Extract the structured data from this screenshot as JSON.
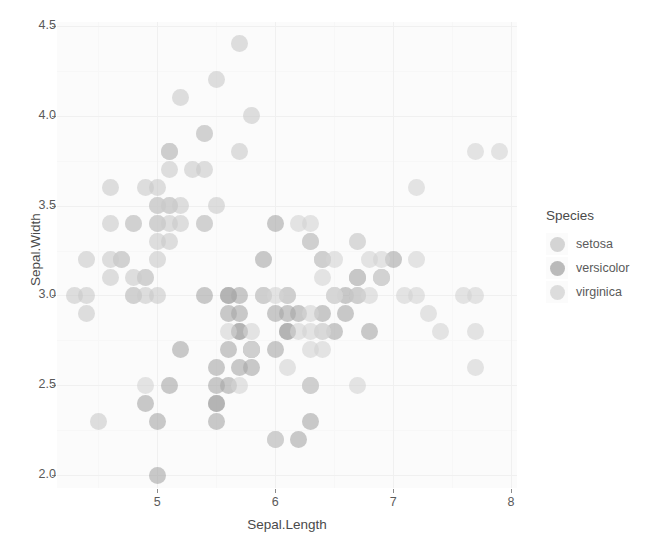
{
  "toolbar": {
    "visible_fragment": true,
    "icons": [
      "save-icon",
      "folder-icon",
      "cursor-icon",
      "zoom-icon"
    ],
    "field_placeholder": ""
  },
  "chart": {
    "type": "scatter",
    "panel_background": "#fbfbfb",
    "grid": "on",
    "point_opacity": 0.62,
    "point_size_px": 17
  },
  "axes": {
    "x": {
      "label": "Sepal.Length",
      "ticks": [
        "5",
        "6",
        "7",
        "8"
      ],
      "tick_values": [
        5,
        6,
        7,
        8
      ],
      "range": [
        4.15,
        8.05
      ]
    },
    "y": {
      "label": "Sepal.Width",
      "ticks": [
        "4.5",
        "4.0",
        "3.5",
        "3.0",
        "2.5",
        "2.0"
      ],
      "tick_values": [
        4.5,
        4.0,
        3.5,
        3.0,
        2.5,
        2.0
      ],
      "range": [
        1.93,
        4.52
      ]
    }
  },
  "legend": {
    "title": "Species",
    "position": "right",
    "items": [
      {
        "label": "setosa",
        "color": "#c9c9c9"
      },
      {
        "label": "versicolor",
        "color": "#a8a8a8"
      },
      {
        "label": "virginica",
        "color": "#d4d4d4"
      }
    ]
  },
  "chart_data": {
    "type": "scatter",
    "title": "",
    "xlabel": "Sepal.Length",
    "ylabel": "Sepal.Width",
    "xlim": [
      4.15,
      8.05
    ],
    "ylim": [
      1.93,
      4.52
    ],
    "xticks": [
      5,
      6,
      7,
      8
    ],
    "yticks": [
      2.0,
      2.5,
      3.0,
      3.5,
      4.0,
      4.5
    ],
    "grid": true,
    "legend_title": "Species",
    "legend_position": "right",
    "series": [
      {
        "name": "setosa",
        "color": "#c9c9c9",
        "x": [
          5.1,
          4.9,
          4.7,
          4.6,
          5.0,
          5.4,
          4.6,
          5.0,
          4.4,
          4.9,
          5.4,
          4.8,
          4.8,
          4.3,
          5.8,
          5.7,
          5.4,
          5.1,
          5.7,
          5.1,
          5.4,
          5.1,
          4.6,
          5.1,
          4.8,
          5.0,
          5.0,
          5.2,
          5.2,
          4.7,
          4.8,
          5.4,
          5.2,
          5.5,
          4.9,
          5.0,
          5.5,
          4.9,
          4.4,
          5.1,
          5.0,
          4.5,
          4.4,
          5.0,
          5.1,
          4.8,
          5.1,
          4.6,
          5.3,
          5.0
        ],
        "y": [
          3.5,
          3.0,
          3.2,
          3.1,
          3.6,
          3.9,
          3.4,
          3.4,
          2.9,
          3.1,
          3.7,
          3.4,
          3.0,
          3.0,
          4.0,
          4.4,
          3.9,
          3.5,
          3.8,
          3.8,
          3.4,
          3.7,
          3.6,
          3.3,
          3.4,
          3.0,
          3.4,
          3.5,
          3.4,
          3.2,
          3.1,
          3.4,
          4.1,
          4.2,
          3.1,
          3.2,
          3.5,
          3.6,
          3.0,
          3.4,
          3.5,
          2.3,
          3.2,
          3.5,
          3.8,
          3.0,
          3.8,
          3.2,
          3.7,
          3.3
        ]
      },
      {
        "name": "versicolor",
        "color": "#a8a8a8",
        "x": [
          7.0,
          6.4,
          6.9,
          5.5,
          6.5,
          5.7,
          6.3,
          4.9,
          6.6,
          5.2,
          5.0,
          5.9,
          6.0,
          6.1,
          5.6,
          6.7,
          5.6,
          5.8,
          6.2,
          5.6,
          5.9,
          6.1,
          6.3,
          6.1,
          6.4,
          6.6,
          6.8,
          6.7,
          6.0,
          5.7,
          5.5,
          5.5,
          5.8,
          6.0,
          5.4,
          6.0,
          6.7,
          6.3,
          5.6,
          5.5,
          5.5,
          6.1,
          5.8,
          5.0,
          5.6,
          5.7,
          5.7,
          6.2,
          5.1,
          5.7
        ],
        "y": [
          3.2,
          3.2,
          3.1,
          2.3,
          2.8,
          2.8,
          3.3,
          2.4,
          2.9,
          2.7,
          2.0,
          3.0,
          2.2,
          2.9,
          2.9,
          3.1,
          3.0,
          2.7,
          2.2,
          2.5,
          3.2,
          2.8,
          2.5,
          2.8,
          2.9,
          3.0,
          2.8,
          3.0,
          2.9,
          2.6,
          2.4,
          2.4,
          2.7,
          2.7,
          3.0,
          3.4,
          3.1,
          2.3,
          3.0,
          2.5,
          2.6,
          3.0,
          2.6,
          2.3,
          2.7,
          3.0,
          2.9,
          2.9,
          2.5,
          2.8
        ]
      },
      {
        "name": "virginica",
        "color": "#d4d4d4",
        "x": [
          6.3,
          5.8,
          7.1,
          6.3,
          6.5,
          7.6,
          4.9,
          7.3,
          6.7,
          7.2,
          6.5,
          6.4,
          6.8,
          5.7,
          5.8,
          6.4,
          6.5,
          7.7,
          7.7,
          6.0,
          6.9,
          5.6,
          7.7,
          6.3,
          6.7,
          7.2,
          6.2,
          6.1,
          6.4,
          7.2,
          7.4,
          7.9,
          6.4,
          6.3,
          6.1,
          7.7,
          6.3,
          6.4,
          6.0,
          6.9,
          6.7,
          6.9,
          5.8,
          6.8,
          6.7,
          6.7,
          6.3,
          6.5,
          6.2,
          5.9
        ],
        "y": [
          3.3,
          2.7,
          3.0,
          2.9,
          3.0,
          3.0,
          2.5,
          2.9,
          2.5,
          3.6,
          3.2,
          2.7,
          3.0,
          2.5,
          2.8,
          3.2,
          3.0,
          3.8,
          2.6,
          2.2,
          3.2,
          2.8,
          2.8,
          2.7,
          3.3,
          3.2,
          2.8,
          3.0,
          2.8,
          3.0,
          2.8,
          3.8,
          2.8,
          2.8,
          2.6,
          3.0,
          3.4,
          3.1,
          3.0,
          3.1,
          3.1,
          3.1,
          2.7,
          3.2,
          3.3,
          3.0,
          2.5,
          3.0,
          3.4,
          3.0
        ]
      }
    ]
  }
}
